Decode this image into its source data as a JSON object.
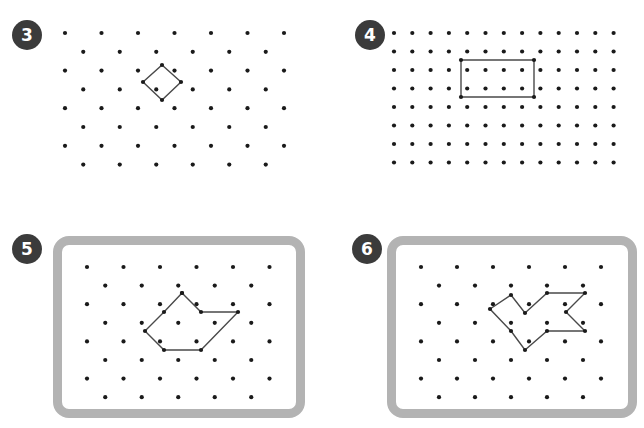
{
  "page": {
    "background_color": "#ffffff",
    "width": 644,
    "height": 428
  },
  "style": {
    "dot_color": "#1a1a1a",
    "shape_stroke_color": "#4a4a4a",
    "frame_color": "#b3b3b3",
    "badge_background": "#3b3b3b",
    "badge_text_color": "#ffffff",
    "dot_radius": 2.1,
    "shape_stroke_width": 1.4
  },
  "panels": [
    {
      "id": "panel-3",
      "number": "3",
      "badge": {
        "x": 12,
        "y": 20
      },
      "framed": false,
      "board": {
        "x": 55,
        "y": 6,
        "width": 240,
        "height": 160
      },
      "grid": {
        "type": "triangular",
        "columns": 7,
        "rows": 8,
        "spacing_x": 36.5,
        "spacing_y": 18.8,
        "origin_x": 10,
        "origin_y": 27,
        "stagger": true
      },
      "shape": {
        "name": "diamond",
        "closed": true,
        "points_grid": [
          {
            "row": 2,
            "col": 4,
            "offset": false
          },
          {
            "row": 3,
            "col": 5,
            "offset": true
          },
          {
            "row": 4,
            "col": 4,
            "offset": false
          },
          {
            "row": 3,
            "col": 4,
            "offset": true
          }
        ]
      }
    },
    {
      "id": "panel-4",
      "number": "4",
      "badge": {
        "x": 355,
        "y": 20
      },
      "framed": false,
      "board": {
        "x": 388,
        "y": 6,
        "width": 230,
        "height": 160
      },
      "grid": {
        "type": "square",
        "columns": 13,
        "rows": 8,
        "spacing_x": 18.3,
        "spacing_y": 18.5,
        "origin_x": 6,
        "origin_y": 27,
        "stagger": false
      },
      "shape": {
        "name": "rectangle",
        "closed": true,
        "points_grid": [
          {
            "row": 2,
            "col": 4
          },
          {
            "row": 2,
            "col": 8
          },
          {
            "row": 4,
            "col": 8
          },
          {
            "row": 4,
            "col": 4
          }
        ]
      }
    },
    {
      "id": "panel-5",
      "number": "5",
      "badge": {
        "x": 12,
        "y": 234
      },
      "framed": true,
      "board": {
        "x": 53,
        "y": 236,
        "width": 252,
        "height": 182
      },
      "grid": {
        "type": "triangular",
        "columns": 6,
        "rows": 8,
        "spacing_x": 36.5,
        "spacing_y": 18.6,
        "origin_x": 25,
        "origin_y": 22,
        "stagger": true
      },
      "shape": {
        "name": "irregular-heptagon",
        "closed": true,
        "points_grid": [
          {
            "row": 1,
            "col": 3,
            "offset": true
          },
          {
            "row": 2,
            "col": 3,
            "offset": true
          },
          {
            "row": 2,
            "col": 5,
            "offset": true
          },
          {
            "row": 3,
            "col": 4,
            "offset": true
          },
          {
            "row": 4,
            "col": 3,
            "offset": false
          },
          {
            "row": 4,
            "col": 2,
            "offset": false
          },
          {
            "row": 3,
            "col": 1,
            "offset": false
          },
          {
            "row": 2,
            "col": 2,
            "offset": true
          }
        ]
      }
    },
    {
      "id": "panel-6",
      "number": "6",
      "badge": {
        "x": 352,
        "y": 234
      },
      "framed": true,
      "board": {
        "x": 387,
        "y": 236,
        "width": 250,
        "height": 182
      },
      "grid": {
        "type": "triangular",
        "columns": 6,
        "rows": 8,
        "spacing_x": 36.0,
        "spacing_y": 18.6,
        "origin_x": 25,
        "origin_y": 22,
        "stagger": true
      },
      "shape": {
        "name": "arrow-chevron",
        "closed": true,
        "points_grid": [
          {
            "row": 1,
            "col": 2,
            "offset": true
          },
          {
            "row": 2,
            "col": 2,
            "offset": false
          },
          {
            "row": 1,
            "col": 3,
            "offset": true
          },
          {
            "row": 1,
            "col": 5,
            "offset": true
          },
          {
            "row": 2,
            "col": 4,
            "offset": true
          },
          {
            "row": 3,
            "col": 5,
            "offset": true
          },
          {
            "row": 3,
            "col": 3,
            "offset": true
          },
          {
            "row": 4,
            "col": 3,
            "offset": false
          },
          {
            "row": 3,
            "col": 2,
            "offset": false
          },
          {
            "row": 2,
            "col": 1,
            "offset": true
          }
        ]
      }
    }
  ],
  "shape_geometry": {
    "panel3_diamond": [
      [
        162,
        65
      ],
      [
        181,
        82
      ],
      [
        162,
        100
      ],
      [
        143,
        82
      ]
    ],
    "panel4_rectangle": [
      [
        461,
        60
      ],
      [
        534,
        60
      ],
      [
        534,
        97
      ],
      [
        461,
        97
      ]
    ],
    "panel5_polygon": [
      [
        173,
        284
      ],
      [
        155,
        303
      ],
      [
        136,
        322
      ],
      [
        155,
        341
      ],
      [
        192,
        341
      ],
      [
        229,
        303
      ],
      [
        192,
        303
      ],
      [
        173,
        284
      ]
    ],
    "panel6_polygon": [
      [
        502,
        286
      ],
      [
        481,
        300
      ],
      [
        502,
        322
      ],
      [
        516,
        341
      ],
      [
        538,
        322
      ],
      [
        576,
        322
      ],
      [
        557,
        303
      ],
      [
        576,
        284
      ],
      [
        538,
        284
      ],
      [
        516,
        304
      ]
    ]
  }
}
